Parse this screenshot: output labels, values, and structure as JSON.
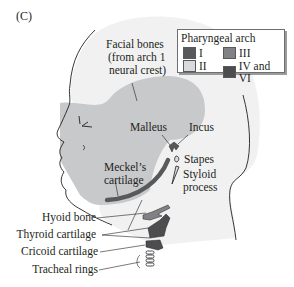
{
  "panel_label": "(C)",
  "legend": {
    "title": "Pharyngeal arch",
    "items": [
      {
        "label": "I",
        "color": "#58595b"
      },
      {
        "label": "III",
        "color": "#808285"
      },
      {
        "label": "II",
        "color": "#d9dadb"
      },
      {
        "label": "IV and VI",
        "color": "#4d4d4f"
      }
    ]
  },
  "labels": {
    "facial_bones_line1": "Facial bones",
    "facial_bones_line2": "(from arch 1",
    "facial_bones_line3": "neural crest)",
    "malleus": "Malleus",
    "incus": "Incus",
    "stapes": "Stapes",
    "styloid_line1": "Styloid",
    "styloid_line2": "process",
    "meckels_line1": "Meckel’s",
    "meckels_line2": "cartilage",
    "hyoid": "Hyoid bone",
    "thyroid": "Thyroid cartilage",
    "cricoid": "Cricoid cartilage",
    "tracheal": "Tracheal rings"
  },
  "colors": {
    "facial_bones_fill": "#c8c9cb",
    "head_fill": "#f1f1f2",
    "outline": "#231f20",
    "arch1": "#58595b",
    "arch3": "#808285",
    "arch4_6": "#4d4d4f"
  }
}
